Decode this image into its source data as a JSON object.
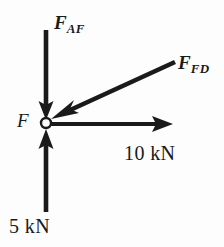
{
  "figure": {
    "type": "free-body-force-diagram",
    "background_color": "#fdfdfd",
    "stroke_color": "#1a1a1a",
    "node": {
      "label": "F",
      "shape": "circle",
      "filled": false,
      "center_x": 46,
      "center_y": 123,
      "radius": 5
    },
    "forces": [
      {
        "name": "F_AF",
        "label_main": "F",
        "label_sub": "AF",
        "direction": "down",
        "arrowhead": "at-node",
        "tail_x": 46,
        "tail_y": 30,
        "head_x": 46,
        "head_y": 117
      },
      {
        "name": "F_FD",
        "label_main": "F",
        "label_sub": "FD",
        "direction": "down-left-diagonal",
        "arrowhead": "at-node",
        "tail_x": 175,
        "tail_y": 62,
        "head_x": 51,
        "head_y": 119
      },
      {
        "name": "force-10kN",
        "label_main": "10 kN",
        "direction": "right",
        "arrowhead": "away-from-node",
        "tail_x": 50,
        "tail_y": 124,
        "head_x": 173,
        "head_y": 124
      },
      {
        "name": "force-5kN",
        "label_main": "5 kN",
        "direction": "up",
        "arrowhead": "at-node",
        "tail_x": 46,
        "tail_y": 212,
        "head_x": 46,
        "head_y": 130
      }
    ]
  },
  "labels": {
    "f_af_main": "F",
    "f_af_sub": "AF",
    "f_fd_main": "F",
    "f_fd_sub": "FD",
    "node_point": "F",
    "magnitude_horizontal": "10 kN",
    "magnitude_vertical": "5 kN"
  }
}
